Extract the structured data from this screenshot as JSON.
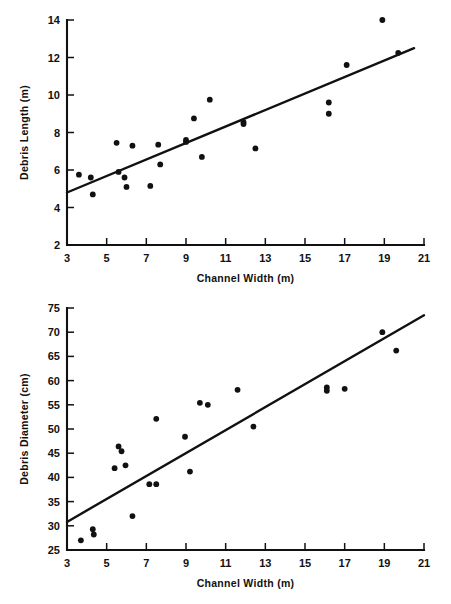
{
  "figure": {
    "title": "",
    "panels": [
      "debris-length-vs-channel-width",
      "debris-diameter-vs-channel-width"
    ]
  },
  "chart_data": [
    {
      "type": "scatter",
      "id": "debris-length",
      "title": "",
      "xlabel": "Channel Width (m)",
      "ylabel": "Debris Length (m)",
      "xlim": [
        3,
        21
      ],
      "ylim": [
        2,
        14
      ],
      "xticks": [
        3,
        5,
        7,
        9,
        11,
        13,
        15,
        17,
        19,
        21
      ],
      "yticks": [
        2,
        4,
        6,
        8,
        10,
        12,
        14
      ],
      "grid": false,
      "legend": null,
      "points": [
        [
          3.6,
          5.75
        ],
        [
          4.2,
          5.6
        ],
        [
          4.3,
          4.7
        ],
        [
          5.5,
          7.45
        ],
        [
          5.6,
          5.9
        ],
        [
          5.9,
          5.6
        ],
        [
          6.0,
          5.1
        ],
        [
          6.3,
          7.3
        ],
        [
          7.2,
          5.15
        ],
        [
          7.6,
          7.35
        ],
        [
          7.7,
          6.3
        ],
        [
          9.0,
          7.6
        ],
        [
          9.0,
          7.5
        ],
        [
          9.4,
          8.75
        ],
        [
          9.8,
          6.7
        ],
        [
          10.2,
          9.75
        ],
        [
          11.9,
          8.55
        ],
        [
          11.9,
          8.45
        ],
        [
          12.5,
          7.15
        ],
        [
          16.2,
          9.6
        ],
        [
          16.2,
          9.0
        ],
        [
          17.1,
          11.6
        ],
        [
          18.9,
          14.0
        ],
        [
          19.7,
          12.25
        ]
      ],
      "fit_line": {
        "x": [
          3.0,
          20.5
        ],
        "y": [
          4.8,
          12.5
        ],
        "style": "solid"
      }
    },
    {
      "type": "scatter",
      "id": "debris-diameter",
      "title": "",
      "xlabel": "Channel Width (m)",
      "ylabel": "Debris Diameter (cm)",
      "xlim": [
        3,
        21
      ],
      "ylim": [
        25,
        75
      ],
      "xticks": [
        3,
        5,
        7,
        9,
        11,
        13,
        15,
        17,
        19,
        21
      ],
      "yticks": [
        25,
        30,
        35,
        40,
        45,
        50,
        55,
        60,
        65,
        70,
        75
      ],
      "grid": false,
      "legend": null,
      "points": [
        [
          3.7,
          27.0
        ],
        [
          4.3,
          29.3
        ],
        [
          4.35,
          28.2
        ],
        [
          5.4,
          41.9
        ],
        [
          5.6,
          46.4
        ],
        [
          5.75,
          45.4
        ],
        [
          5.95,
          42.5
        ],
        [
          6.3,
          32.0
        ],
        [
          7.15,
          38.6
        ],
        [
          7.5,
          38.6
        ],
        [
          7.5,
          52.1
        ],
        [
          8.95,
          48.4
        ],
        [
          9.2,
          41.2
        ],
        [
          9.7,
          55.4
        ],
        [
          10.1,
          55.0
        ],
        [
          11.6,
          58.1
        ],
        [
          12.4,
          50.5
        ],
        [
          16.1,
          58.6
        ],
        [
          16.1,
          57.9
        ],
        [
          17.0,
          58.3
        ],
        [
          18.9,
          70.0
        ],
        [
          19.6,
          66.2
        ]
      ],
      "fit_line": {
        "x": [
          3.0,
          21.0
        ],
        "y": [
          30.8,
          73.5
        ],
        "style": "solid"
      }
    }
  ],
  "colors": {
    "ink": "#111111",
    "background": "#ffffff"
  }
}
